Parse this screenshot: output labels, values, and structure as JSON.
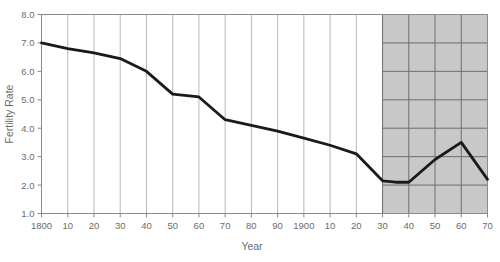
{
  "chart_data": {
    "type": "line",
    "title": "",
    "xlabel": "Year",
    "ylabel": "Fertility Rate",
    "xlim": [
      1800,
      1970
    ],
    "ylim": [
      1.0,
      8.0
    ],
    "grid": true,
    "legend": "none",
    "x_tick_labels": [
      "1800",
      "10",
      "20",
      "30",
      "40",
      "50",
      "60",
      "70",
      "80",
      "90",
      "1900",
      "10",
      "20",
      "30",
      "40",
      "50",
      "60",
      "70"
    ],
    "x_tick_values": [
      1800,
      1810,
      1820,
      1830,
      1840,
      1850,
      1860,
      1870,
      1880,
      1890,
      1900,
      1910,
      1920,
      1930,
      1940,
      1950,
      1960,
      1970
    ],
    "y_tick_labels": [
      "1.0",
      "2.0",
      "3.0",
      "4.0",
      "5.0",
      "6.0",
      "7.0",
      "8.0"
    ],
    "y_tick_values": [
      1.0,
      2.0,
      3.0,
      4.0,
      5.0,
      6.0,
      7.0,
      8.0
    ],
    "x": [
      1800,
      1810,
      1820,
      1830,
      1840,
      1850,
      1860,
      1870,
      1880,
      1890,
      1900,
      1910,
      1920,
      1930,
      1935,
      1940,
      1950,
      1960,
      1970
    ],
    "values": [
      7.0,
      6.8,
      6.65,
      6.45,
      6.0,
      5.2,
      5.1,
      4.3,
      4.1,
      3.9,
      3.65,
      3.4,
      3.1,
      2.15,
      2.1,
      2.1,
      2.9,
      3.5,
      2.2
    ],
    "series": [
      {
        "name": "Fertility Rate",
        "color": "#1a1a1a",
        "values": [
          7.0,
          6.8,
          6.65,
          6.45,
          6.0,
          5.2,
          5.1,
          4.3,
          4.1,
          3.9,
          3.65,
          3.4,
          3.1,
          2.15,
          2.1,
          2.1,
          2.9,
          3.5,
          2.2
        ]
      }
    ],
    "shaded_region": {
      "label": "",
      "x_start": 1930,
      "x_end": 1970,
      "fill_color": "#c8c8c8",
      "grid_color": "#6e6e6e"
    },
    "colors": {
      "line": "#1a1a1a",
      "grid": "#b0b0b0",
      "axis": "#8a8a8a",
      "text": "#6b6b6b",
      "background": "#ffffff"
    }
  }
}
